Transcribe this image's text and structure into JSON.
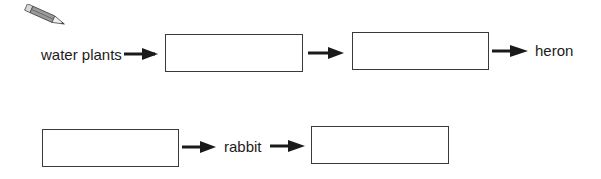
{
  "diagram": {
    "type": "food-chain",
    "icon": "pencil-icon",
    "row1": {
      "start_label": "water plants",
      "boxes": [
        {
          "value": ""
        },
        {
          "value": ""
        }
      ],
      "end_label": "heron"
    },
    "row2": {
      "boxes": [
        {
          "value": ""
        },
        {
          "value": ""
        }
      ],
      "middle_label": "rabbit"
    },
    "colors": {
      "ink": "#1a1a1a",
      "box_border": "#3a3a3a",
      "pencil": "#8a8a8a"
    }
  }
}
